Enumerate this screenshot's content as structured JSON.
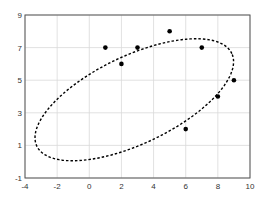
{
  "chart_data": {
    "type": "scatter",
    "title": "",
    "xlabel": "",
    "ylabel": "",
    "xlim": [
      -4,
      10
    ],
    "ylim": [
      -1,
      9
    ],
    "grid": true,
    "x_ticks": [
      "-4",
      "-2",
      "0",
      "2",
      "4",
      "6",
      "8",
      "10"
    ],
    "y_ticks": [
      "-1",
      "1",
      "3",
      "5",
      "7",
      "9"
    ],
    "points": [
      {
        "x": 1,
        "y": 7
      },
      {
        "x": 2,
        "y": 6
      },
      {
        "x": 3,
        "y": 7
      },
      {
        "x": 5,
        "y": 8
      },
      {
        "x": 7,
        "y": 7
      },
      {
        "x": 9,
        "y": 5
      },
      {
        "x": 8,
        "y": 4
      },
      {
        "x": 6,
        "y": 2
      }
    ],
    "ellipse": {
      "cx": 2.8,
      "cy": 3.8,
      "a": 6.7,
      "b": 2.7,
      "angle_deg": 25,
      "style": "dashed"
    },
    "colors": {
      "points": "#000000",
      "ellipse": "#000000",
      "grid": "#d9d9d9",
      "axes": "#555555"
    }
  }
}
